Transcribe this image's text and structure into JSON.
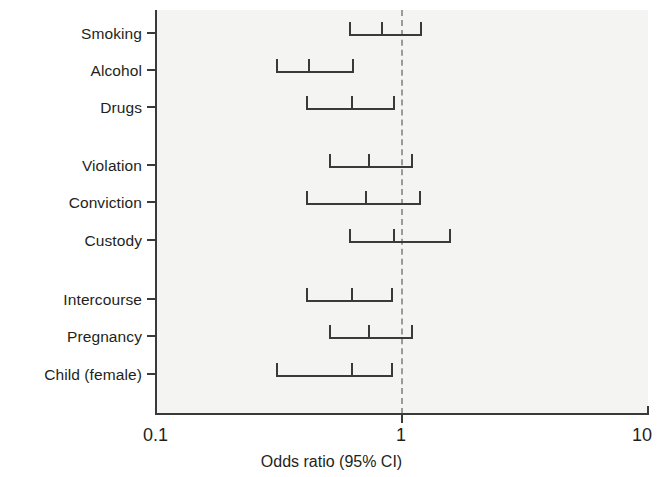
{
  "chart_data": {
    "type": "bar",
    "subtype": "forest-plot",
    "title": "",
    "xlabel": "Odds ratio (95% CI)",
    "ylabel": "",
    "xscale": "log",
    "xlim": [
      0.1,
      10
    ],
    "xticks": [
      0.1,
      1,
      10
    ],
    "xticklabels": [
      "0.1",
      "1",
      "10"
    ],
    "grid": false,
    "legend": null,
    "reference_line": 1,
    "reference_line_style": "dashed",
    "categories": [
      "Smoking",
      "Alcohol",
      "Drugs",
      "Violation",
      "Conviction",
      "Custody",
      "Intercourse",
      "Pregnancy",
      "Child (female)"
    ],
    "groups": [
      {
        "name": "Substance use",
        "members": [
          "Smoking",
          "Alcohol",
          "Drugs"
        ]
      },
      {
        "name": "Offending",
        "members": [
          "Violation",
          "Conviction",
          "Custody"
        ]
      },
      {
        "name": "Sexual behaviour",
        "members": [
          "Intercourse",
          "Pregnancy",
          "Child (female)"
        ]
      }
    ],
    "series": [
      {
        "name": "Odds ratio (95% CI)",
        "points": [
          {
            "label": "Smoking",
            "estimate": 0.83,
            "ci_low": 0.61,
            "ci_high": 1.21
          },
          {
            "label": "Alcohol",
            "estimate": 0.42,
            "ci_low": 0.31,
            "ci_high": 0.64
          },
          {
            "label": "Drugs",
            "estimate": 0.63,
            "ci_low": 0.41,
            "ci_high": 0.94
          },
          {
            "label": "Violation",
            "estimate": 0.74,
            "ci_low": 0.51,
            "ci_high": 1.11
          },
          {
            "label": "Conviction",
            "estimate": 0.72,
            "ci_low": 0.41,
            "ci_high": 1.2
          },
          {
            "label": "Custody",
            "estimate": 0.93,
            "ci_low": 0.61,
            "ci_high": 1.59
          },
          {
            "label": "Intercourse",
            "estimate": 0.63,
            "ci_low": 0.41,
            "ci_high": 0.92
          },
          {
            "label": "Pregnancy",
            "estimate": 0.74,
            "ci_low": 0.51,
            "ci_high": 1.11
          },
          {
            "label": "Child (female)",
            "estimate": 0.63,
            "ci_low": 0.31,
            "ci_high": 0.92
          }
        ]
      }
    ],
    "values": [
      0.83,
      0.42,
      0.63,
      0.74,
      0.72,
      0.93,
      0.63,
      0.74,
      0.63
    ]
  },
  "axis": {
    "x_title": "Odds ratio (95% CI)",
    "x_min_label": "0.1",
    "x_mid_label": "1",
    "x_max_label": "10"
  },
  "rows": [
    {
      "label": "Smoking",
      "y": 33,
      "estimate": 0.83,
      "ci_low": 0.61,
      "ci_high": 1.21
    },
    {
      "label": "Alcohol",
      "y": 70,
      "estimate": 0.42,
      "ci_low": 0.31,
      "ci_high": 0.64
    },
    {
      "label": "Drugs",
      "y": 107,
      "estimate": 0.63,
      "ci_low": 0.41,
      "ci_high": 0.94
    },
    {
      "label": "Violation",
      "y": 165,
      "estimate": 0.74,
      "ci_low": 0.51,
      "ci_high": 1.11
    },
    {
      "label": "Conviction",
      "y": 202,
      "estimate": 0.72,
      "ci_low": 0.41,
      "ci_high": 1.2
    },
    {
      "label": "Custody",
      "y": 240,
      "estimate": 0.93,
      "ci_low": 0.61,
      "ci_high": 1.59
    },
    {
      "label": "Intercourse",
      "y": 299,
      "estimate": 0.63,
      "ci_low": 0.41,
      "ci_high": 0.92
    },
    {
      "label": "Pregnancy",
      "y": 336,
      "estimate": 0.74,
      "ci_low": 0.51,
      "ci_high": 1.11
    },
    {
      "label": "Child (female)",
      "y": 374,
      "estimate": 0.63,
      "ci_low": 0.31,
      "ci_high": 0.92
    }
  ],
  "colors": {
    "ink": "#231f20",
    "axis": "#3a3a3a",
    "panel": "#f4f4f2",
    "null_line": "#9a9a9a",
    "background": "#ffffff"
  }
}
